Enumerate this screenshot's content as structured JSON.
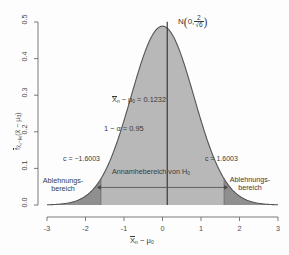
{
  "chart_data": {
    "type": "area",
    "title": "",
    "xlabel": "X̄ₙ − μ₀",
    "ylabel": "f X̄ₙ−μ₀ (x̄ − μ₀)",
    "xlim": [
      -3,
      3
    ],
    "ylim": [
      0,
      0.5
    ],
    "grid": false,
    "legend_position": "none",
    "distribution": {
      "family": "normal",
      "mean": 0,
      "sd_expression": "2/√6",
      "sd_value": 0.8165,
      "peak_density": 0.4886
    },
    "x_ticks": [
      -3,
      -2,
      -1,
      0,
      1,
      2,
      3
    ],
    "x_tick_labels": [
      "-3",
      "-2",
      "-1",
      "0",
      "1",
      "2",
      "3"
    ],
    "y_ticks": [
      0.0,
      0.1,
      0.2,
      0.3,
      0.4,
      0.5
    ],
    "y_tick_labels": [
      "0.0",
      "0.1",
      "0.2",
      "0.3",
      "0.4",
      "0.5"
    ],
    "critical_values": [
      -1.6003,
      1.6003
    ],
    "observed_statistic": 0.1232,
    "confidence_level": 0.95,
    "alpha": 0.05,
    "regions": [
      {
        "name": "acceptance",
        "from": -1.6003,
        "to": 1.6003,
        "fill": "#b8b8b8"
      },
      {
        "name": "rejection-left",
        "from": -3,
        "to": -1.6003,
        "fill": "#8f8f8f"
      },
      {
        "name": "rejection-right",
        "from": 1.6003,
        "to": 3,
        "fill": "#8f8f8f"
      }
    ]
  },
  "axes": {
    "x_title": "X̄ₙ − μ₀",
    "y_title": "f X̄ₙ−μ₀ (x̄ − μ₀)",
    "x_ticks": [
      "-3",
      "-2",
      "-1",
      "0",
      "1",
      "2",
      "3"
    ],
    "y_ticks": [
      "0.0",
      "0.1",
      "0.2",
      "0.3",
      "0.4",
      "0.5"
    ]
  },
  "annotations": {
    "distribution_label_prefix": "N",
    "distribution_mean": "0,",
    "distribution_sd_num": "2",
    "distribution_sd_den": "√6",
    "observed_label": "X̄ₙ − μ₀ = 0.1232",
    "confidence_label": "1 − α = 0.95",
    "critical_low_label": "c = −1.6003",
    "critical_high_label": "c = 1.6003",
    "acceptance_label": "Annamhebereich von H₀",
    "rejection_left_line1": "Ablehnungs-",
    "rejection_left_line2": "bereich",
    "rejection_right_line1": "Ablehnungs-",
    "rejection_right_line2": "bereich"
  },
  "colors": {
    "acceptance_fill": "#b8b8b8",
    "rejection_fill": "#8f8f8f",
    "curve_stroke": "#555555",
    "axis_stroke": "#6b6b6b",
    "text": "#3a3a3a",
    "background": "#fdfdfd"
  }
}
